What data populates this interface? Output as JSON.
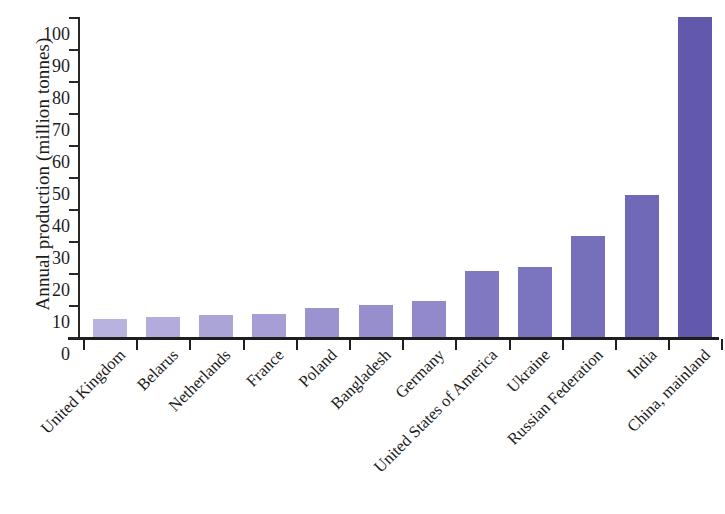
{
  "chart_data": {
    "type": "bar",
    "title": "",
    "subtitle": "",
    "xlabel": "",
    "ylabel": "Annual production (million tonnes)",
    "ylim": [
      0,
      100
    ],
    "yticks": [
      "100",
      "90",
      "80",
      "70",
      "60",
      "50",
      "40",
      "30",
      "20",
      "10",
      "0"
    ],
    "grid": false,
    "legend": null,
    "categories": [
      "United Kingdom",
      "Belarus",
      "Netherlands",
      "France",
      "Poland",
      "Bangladesh",
      "Germany",
      "United States of America",
      "Ukraine",
      "Russian Federation",
      "India",
      "China, mainland"
    ],
    "values": [
      5.5,
      6.3,
      6.8,
      7.2,
      9.1,
      10.0,
      11.3,
      20.5,
      22.0,
      31.5,
      44.3,
      100.0
    ],
    "bar_colors": [
      "#b7b2de",
      "#b2abdb",
      "#aba4d7",
      "#a69ed5",
      "#9b93cf",
      "#968ecd",
      "#9189ca",
      "#8079c1",
      "#7b74be",
      "#7670bb",
      "#6f69b7",
      "#6259ad"
    ],
    "axis_color": "#1e1e1e"
  }
}
